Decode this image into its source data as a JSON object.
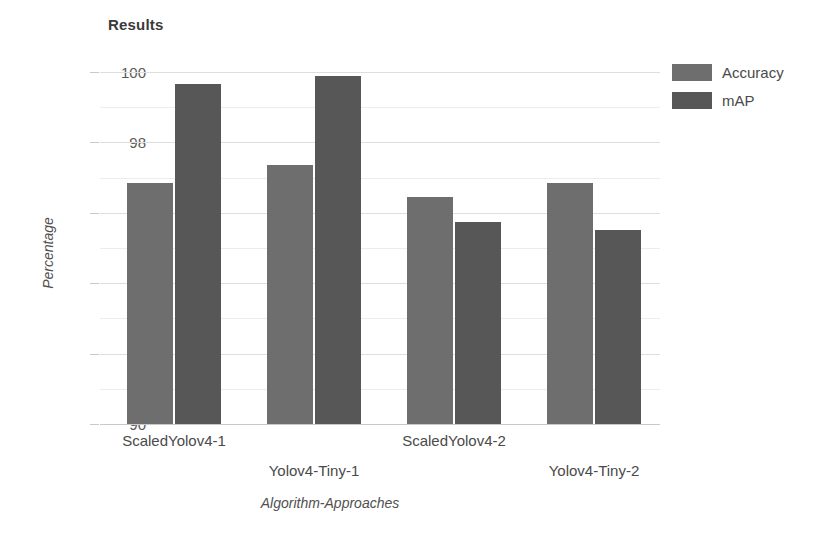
{
  "chart_data": {
    "type": "bar",
    "title": "Results",
    "xlabel": "Algorithm-Approaches",
    "ylabel": "Percentage",
    "categories": [
      "ScaledYolov4-1",
      "Yolov4-Tiny-1",
      "ScaledYolov4-2",
      "Yolov4-Tiny-2"
    ],
    "series": [
      {
        "name": "Accuracy",
        "color": "#6e6e6e",
        "values": [
          96.85,
          97.35,
          96.45,
          96.85
        ]
      },
      {
        "name": "mAP",
        "color": "#575757",
        "values": [
          99.65,
          99.9,
          95.75,
          95.5
        ]
      }
    ],
    "ylim": [
      90,
      100
    ],
    "yticks": [
      90,
      92,
      94,
      96,
      98,
      100
    ],
    "ytick_labels": [
      "90",
      "92",
      "94",
      "96",
      "98",
      "100"
    ],
    "minor_yticks": [
      91,
      93,
      95,
      97,
      99
    ],
    "grid": true,
    "legend_position": "right"
  }
}
